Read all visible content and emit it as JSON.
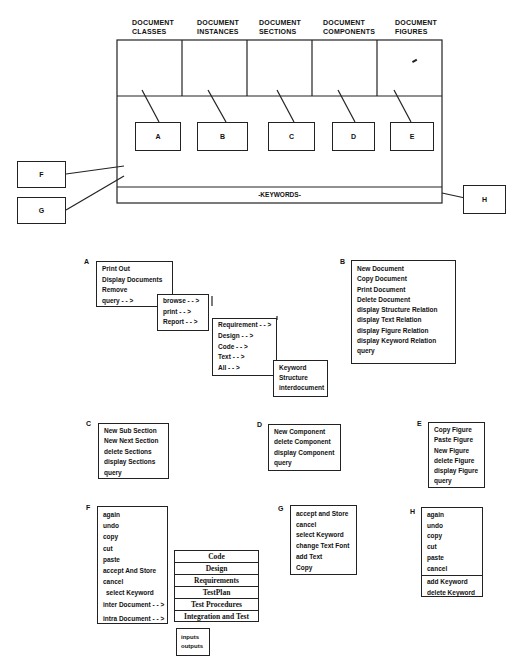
{
  "header_columns": [
    {
      "line1": "DOCUMENT",
      "line2": "CLASSES"
    },
    {
      "line1": "DOCUMENT",
      "line2": "INSTANCES"
    },
    {
      "line1": "DOCUMENT",
      "line2": "SECTIONS"
    },
    {
      "line1": "DOCUMENT",
      "line2": "COMPONENTS"
    },
    {
      "line1": "DOCUMENT",
      "line2": "FIGURES"
    }
  ],
  "callouts": {
    "a": "A",
    "b": "B",
    "c": "C",
    "d": "D",
    "e": "E",
    "f": "F",
    "g": "G",
    "h": "H"
  },
  "keywords_bar": "-KEYWORDS-",
  "menus": {
    "A": {
      "key": "A",
      "items": [
        "Print Out",
        "Display Documents",
        "Remove",
        "query - - >"
      ],
      "query_sub": [
        "browse - - >",
        "print - - >",
        "Report - - >"
      ],
      "report_sub": [
        "Requirement - - >",
        "Design - - >",
        "Code - - >",
        "Text - - >",
        "All - - >"
      ],
      "all_sub": [
        "Keyword",
        "Structure",
        "interdocument"
      ]
    },
    "B": {
      "key": "B",
      "items": [
        "New Document",
        "Copy Document",
        "Print Document",
        "Delete Document",
        "display Structure Relation",
        "display Text Relation",
        "display Figure Relation",
        "display Keyword Relation",
        "query"
      ]
    },
    "C": {
      "key": "C",
      "items": [
        "New Sub Section",
        "New Next Section",
        "delete Sections",
        "display Sections",
        "query"
      ]
    },
    "D": {
      "key": "D",
      "items": [
        "New Component",
        "delete Component",
        "display Component",
        "query"
      ]
    },
    "E": {
      "key": "E",
      "items": [
        "Copy Figure",
        "Paste Figure",
        "New Figure",
        "delete Figure",
        "display Figure",
        "query"
      ]
    },
    "F": {
      "key": "F",
      "items": [
        "again",
        "undo",
        "copy",
        "cut",
        "paste",
        "accept And Store",
        "cancel",
        "select Keyword",
        "inter Document - - >",
        "intra Document - - >"
      ],
      "inter_sub": [
        "Code",
        "Design",
        "Requirements",
        "TestPlan",
        "Test Procedures",
        "Integration and Test"
      ],
      "intra_sub": [
        "inputs",
        "outputs"
      ]
    },
    "G": {
      "key": "G",
      "items": [
        "accept and Store",
        "cancel",
        "select Keyword",
        "change Text Font",
        "add Text",
        "Copy"
      ]
    },
    "H": {
      "key": "H",
      "items": [
        "again",
        "undo",
        "copy",
        "cut",
        "paste",
        "cancel"
      ],
      "items2": [
        "add Keyword",
        "delete Keyword"
      ]
    }
  }
}
